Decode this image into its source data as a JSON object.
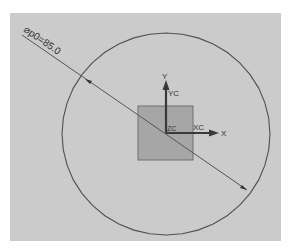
{
  "viewport": {
    "background": "#ffffff",
    "panel_color": "#cbcbcb",
    "line_color": "#505050"
  },
  "circle": {
    "cx": 166,
    "cy": 134,
    "rx": 104,
    "ry": 101,
    "segments": 40
  },
  "dimension": {
    "label": "⌀p0=85.0",
    "x1": 22,
    "y1": 35,
    "x2": 247,
    "y2": 190,
    "text_x": 22,
    "text_y": 33,
    "angle": 34.6
  },
  "square": {
    "x": 138,
    "y": 106,
    "w": 55,
    "h": 54,
    "fill": "#a6a6a6",
    "stroke": "#6e6e6e"
  },
  "axes": {
    "origin_x": 166,
    "origin_y": 133,
    "x_axis_label": "X",
    "xc_label": "XC",
    "y_axis_label": "Y",
    "yc_label": "YC",
    "zc_label": "ZC"
  }
}
